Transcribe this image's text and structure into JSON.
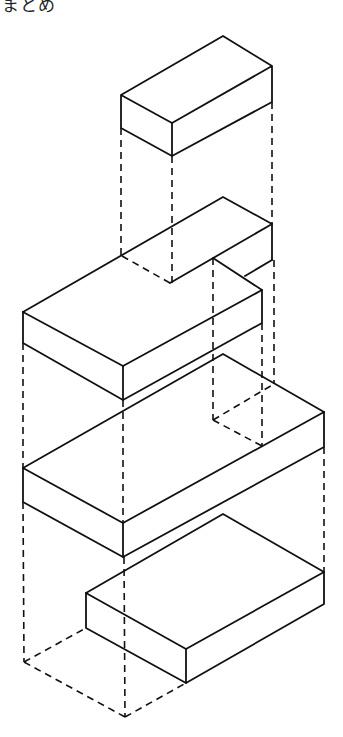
{
  "caption": {
    "text": "まとめ",
    "note": "partially cropped text at top-left"
  },
  "diagram": {
    "stroke_color": "#111111",
    "background": "#ffffff",
    "parts": [
      {
        "id": "top-block",
        "label": "small rectangular block"
      },
      {
        "id": "l-shaped-block",
        "label": "L-shaped block with notch"
      },
      {
        "id": "middle-slab",
        "label": "large rectangular slab"
      },
      {
        "id": "bottom-block",
        "label": "bottom rectangular block"
      }
    ],
    "projection_lines": "dashed vertical alignment lines"
  }
}
